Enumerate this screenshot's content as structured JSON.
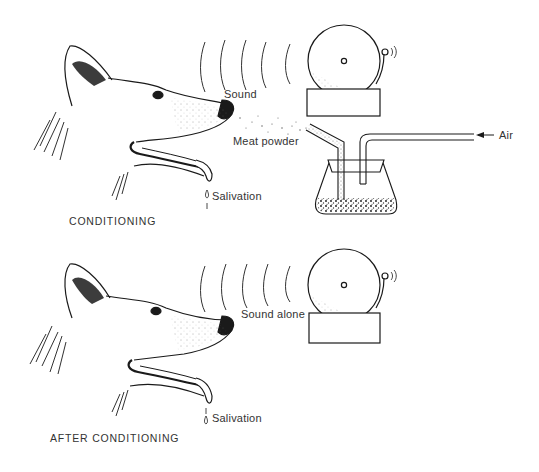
{
  "diagram": {
    "panels": [
      {
        "caption": "CONDITIONING",
        "labels": {
          "sound": "Sound",
          "meat_powder": "Meat powder",
          "air": "Air",
          "salivation": "Salivation"
        },
        "components": [
          "dog-head",
          "sound-waves",
          "bell",
          "flask",
          "air-tube",
          "powder-tube",
          "saliva-drops"
        ]
      },
      {
        "caption": "AFTER CONDITIONING",
        "labels": {
          "sound": "Sound alone",
          "salivation": "Salivation"
        },
        "components": [
          "dog-head",
          "sound-waves",
          "bell",
          "saliva-drops"
        ]
      }
    ],
    "colors": {
      "ink": "#1a1a1a",
      "text": "#333333",
      "background": "#ffffff"
    }
  }
}
